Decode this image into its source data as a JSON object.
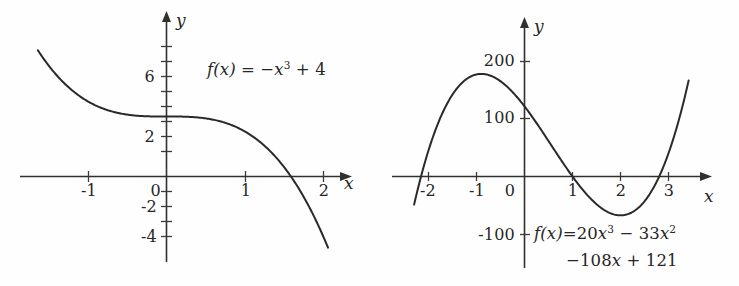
{
  "figure": {
    "background_color": "#fefefe",
    "curve_color": "#2a2a29",
    "axis_color": "#30302f"
  },
  "panels": [
    {
      "id": "left",
      "x_axis_name": "x",
      "y_axis_name": "y",
      "formula_display": "f(x) = −x³ + 4",
      "formula_parts": {
        "fx": "f(x)",
        "equals": "=",
        "minus": "−",
        "base": "x",
        "exponent": "3",
        "plus": "+",
        "constant": "4"
      },
      "x_ticks": [
        "-1",
        "1",
        "2"
      ],
      "y_ticks": [
        "6",
        "2",
        "-2",
        "-4"
      ],
      "origin_label": "0"
    },
    {
      "id": "right",
      "x_axis_name": "x",
      "y_axis_name": "y",
      "formula_display": "f(x)=20x³ − 33x² − 108x + 121",
      "formula_line1_parts": {
        "fx": "f(x)=",
        "coef1": "20",
        "base1": "x",
        "exp1": "3",
        "minus1": "−",
        "coef2": "33",
        "base2": "x",
        "exp2": "2"
      },
      "formula_line2_parts": {
        "minus2": "−",
        "coef3": "108",
        "base3": "x",
        "plus": "+",
        "constant": "121"
      },
      "x_ticks": [
        "-2",
        "-1",
        "1",
        "2",
        "3"
      ],
      "y_ticks": [
        "200",
        "100",
        "-100"
      ],
      "origin_label": "0"
    }
  ],
  "chart_data": [
    {
      "type": "line",
      "panel": "left",
      "title": "",
      "expression": "f(x) = -x^3 + 4",
      "coefficients": {
        "x3": -1,
        "x2": 0,
        "x1": 0,
        "x0": 4
      },
      "xlabel": "x",
      "ylabel": "y",
      "xlim": [
        -1.65,
        2.15
      ],
      "ylim": [
        -4.6,
        8.6
      ],
      "x_tick_values": [
        -1,
        1,
        2
      ],
      "x_tick_labels": [
        "-1",
        "1",
        "2"
      ],
      "y_tick_values": [
        6,
        2,
        -2,
        -4
      ],
      "y_tick_labels": [
        "6",
        "2",
        "-2",
        "-4"
      ],
      "minor_y_tick_values": [
        8,
        7,
        6,
        5,
        4,
        3,
        2,
        1,
        -1,
        -2,
        -3,
        -4
      ],
      "grid": false,
      "legend": false,
      "annotations": [
        {
          "text": "f(x) = -x^3 + 4",
          "x": 0.62,
          "y": 6.2
        }
      ],
      "x": [
        -1.65,
        -1.5,
        -1.25,
        -1.0,
        -0.75,
        -0.5,
        -0.25,
        0.0,
        0.25,
        0.5,
        0.75,
        1.0,
        1.25,
        1.5,
        1.75,
        2.0,
        2.1
      ],
      "y": [
        8.49,
        7.375,
        5.953,
        5.0,
        4.422,
        4.125,
        4.016,
        4.0,
        3.984,
        3.875,
        3.578,
        3.0,
        2.047,
        0.625,
        -1.359,
        -4.0,
        -5.26
      ],
      "roots": [
        1.5874
      ],
      "y_intercept": 4
    },
    {
      "type": "line",
      "panel": "right",
      "title": "",
      "expression": "f(x) = 20x^3 - 33x^2 - 108x + 121",
      "coefficients": {
        "x3": 20,
        "x2": -33,
        "x1": -108,
        "x0": 121
      },
      "xlabel": "x",
      "ylabel": "y",
      "xlim": [
        -2.35,
        3.55
      ],
      "ylim": [
        -160,
        250
      ],
      "x_tick_values": [
        -2,
        -1,
        1,
        2,
        3
      ],
      "x_tick_labels": [
        "-2",
        "-1",
        "1",
        "2",
        "3"
      ],
      "y_tick_values": [
        200,
        100,
        -100
      ],
      "y_tick_labels": [
        "200",
        "100",
        "-100"
      ],
      "grid": false,
      "legend": false,
      "annotations": [
        {
          "text": "f(x)=20x^3 - 33x^2",
          "x": 1.0,
          "y": -100
        },
        {
          "text": "-108x + 121",
          "x": 1.4,
          "y": -140
        }
      ],
      "x": [
        -2.3,
        -2.0,
        -1.75,
        -1.5,
        -1.25,
        -1.0,
        -0.75,
        -0.5,
        -0.25,
        0.0,
        0.25,
        0.5,
        0.75,
        1.0,
        1.25,
        1.5,
        1.75,
        2.0,
        2.25,
        2.5,
        2.75,
        3.0,
        3.25,
        3.4
      ],
      "y": [
        -174.8,
        -95.0,
        -35.4,
        14.5,
        53.4,
        82.0,
        101.1,
        166.0,
        145.8,
        121.0,
        92.3,
        60.5,
        26.2,
        0.0,
        -32.3,
        -61.1,
        -84.3,
        -95.0,
        -95.6,
        -83.0,
        -55.0,
        -20.0,
        36.7,
        79.0
      ]
    }
  ]
}
